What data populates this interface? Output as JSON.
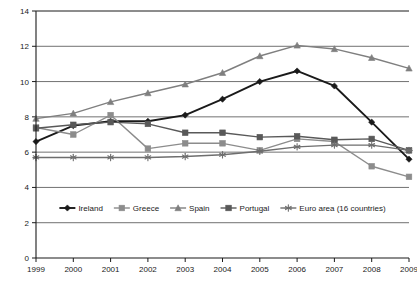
{
  "chart_data": {
    "type": "line",
    "title": "",
    "subtitle": "",
    "xlabel": "",
    "ylabel": "",
    "grid": true,
    "legend_position": "inside-bottom",
    "categories": [
      "1999",
      "2000",
      "2001",
      "2002",
      "2003",
      "2004",
      "2005",
      "2006",
      "2007",
      "2008",
      "2009"
    ],
    "x": [
      1999,
      2000,
      2001,
      2002,
      2003,
      2004,
      2005,
      2006,
      2007,
      2008,
      2009
    ],
    "xlim": [
      1999,
      2009
    ],
    "ylim": [
      0,
      14
    ],
    "yticks": [
      0,
      2,
      4,
      6,
      8,
      10,
      12,
      14
    ],
    "ytick_labels": [
      "0",
      "2",
      "4",
      "6",
      "8",
      "10",
      "12",
      "14"
    ],
    "series": [
      {
        "name": "Ireland",
        "marker": "diamond",
        "color": "#1a1a1a",
        "values": [
          6.6,
          7.5,
          7.75,
          7.75,
          8.1,
          9.0,
          10.0,
          10.6,
          9.75,
          7.7,
          5.6
        ]
      },
      {
        "name": "Greece",
        "marker": "square",
        "color": "#8c8c8c",
        "values": [
          7.4,
          7.0,
          8.1,
          6.2,
          6.5,
          6.5,
          6.1,
          6.75,
          6.6,
          5.2,
          4.6
        ]
      },
      {
        "name": "Spain",
        "marker": "triangle",
        "color": "#7f7f7f",
        "values": [
          7.9,
          8.2,
          8.85,
          9.35,
          9.85,
          10.5,
          11.45,
          12.05,
          11.85,
          11.35,
          10.75
        ]
      },
      {
        "name": "Portugal",
        "marker": "square",
        "color": "#595959",
        "values": [
          7.35,
          7.55,
          7.7,
          7.6,
          7.1,
          7.1,
          6.85,
          6.9,
          6.7,
          6.75,
          6.1
        ]
      },
      {
        "name": "Euro area (16 countries)",
        "marker": "asterisk",
        "color": "#6e6e6e",
        "values": [
          5.7,
          5.7,
          5.7,
          5.7,
          5.75,
          5.85,
          6.05,
          6.3,
          6.4,
          6.4,
          6.1
        ]
      }
    ]
  },
  "legend": {
    "items": [
      {
        "label": "Ireland"
      },
      {
        "label": "Greece"
      },
      {
        "label": "Spain"
      },
      {
        "label": "Portugal"
      },
      {
        "label": "Euro area (16 countries)"
      }
    ]
  }
}
